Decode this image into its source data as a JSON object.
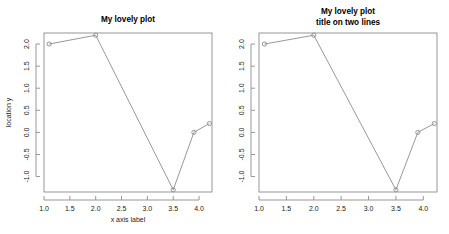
{
  "figure": {
    "background_color": "#ffffff",
    "line_color": "#8c8c8c",
    "text_color": "#000000",
    "layout": "1 row x 2 columns"
  },
  "chart_data": [
    {
      "type": "line",
      "title": "My lovely plot",
      "title_lines": [
        "My lovely plot"
      ],
      "xlabel": "x axis label",
      "ylabel": "location y",
      "x": [
        1.1,
        2.0,
        3.5,
        3.9,
        4.2
      ],
      "values": [
        2.0,
        2.2,
        -1.3,
        0.0,
        0.2
      ],
      "xlim": [
        1.0,
        4.25
      ],
      "ylim": [
        -1.35,
        2.25
      ],
      "xticks": [
        "1.0",
        "1.5",
        "2.0",
        "2.5",
        "3.0",
        "3.5",
        "4.0"
      ],
      "xtick_values": [
        1.0,
        1.5,
        2.0,
        2.5,
        3.0,
        3.5,
        4.0
      ],
      "yticks": [
        "2.0",
        "1.5",
        "1.0",
        "0.5",
        "0.0",
        "-0.5",
        "-1.0"
      ],
      "ytick_values": [
        2.0,
        1.5,
        1.0,
        0.5,
        0.0,
        -0.5,
        -1.0
      ],
      "grid": false,
      "legend": null,
      "marker": "open-circle",
      "line_style": "solid"
    },
    {
      "type": "line",
      "title": "My lovely plot title on two lines",
      "title_lines": [
        "My lovely plot",
        "title on two lines"
      ],
      "xlabel": "",
      "ylabel": "",
      "x": [
        1.1,
        2.0,
        3.5,
        3.9,
        4.2
      ],
      "values": [
        2.0,
        2.2,
        -1.3,
        0.0,
        0.2
      ],
      "xlim": [
        1.0,
        4.25
      ],
      "ylim": [
        -1.35,
        2.25
      ],
      "xticks": [
        "1.0",
        "1.5",
        "2.0",
        "2.5",
        "3.0",
        "3.5",
        "4.0"
      ],
      "xtick_values": [
        1.0,
        1.5,
        2.0,
        2.5,
        3.0,
        3.5,
        4.0
      ],
      "yticks": [
        "2.0",
        "1.5",
        "1.0",
        "0.5",
        "0.0",
        "-0.5",
        "-1.0"
      ],
      "ytick_values": [
        2.0,
        1.5,
        1.0,
        0.5,
        0.0,
        -0.5,
        -1.0
      ],
      "grid": false,
      "legend": null,
      "marker": "open-circle",
      "line_style": "solid"
    }
  ]
}
